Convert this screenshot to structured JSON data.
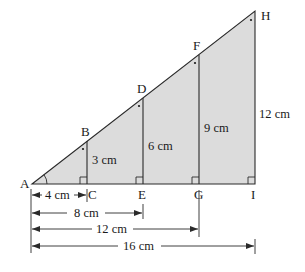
{
  "diagram": {
    "type": "similar-right-triangles",
    "fill_color": "#dcdcdc",
    "line_color": "#2a2a2a",
    "points": {
      "A": {
        "label": "A"
      },
      "B": {
        "label": "B"
      },
      "C": {
        "label": "C"
      },
      "D": {
        "label": "D"
      },
      "E": {
        "label": "E"
      },
      "F": {
        "label": "F"
      },
      "G": {
        "label": "G"
      },
      "H": {
        "label": "H"
      },
      "I": {
        "label": "I"
      }
    },
    "heights": {
      "BC": "3 cm",
      "DE": "6 cm",
      "FG": "9 cm",
      "HI": "12 cm"
    },
    "base_dimensions": {
      "AC": "4 cm",
      "AE": "8 cm",
      "AG": "12 cm",
      "AI": "16 cm"
    }
  }
}
